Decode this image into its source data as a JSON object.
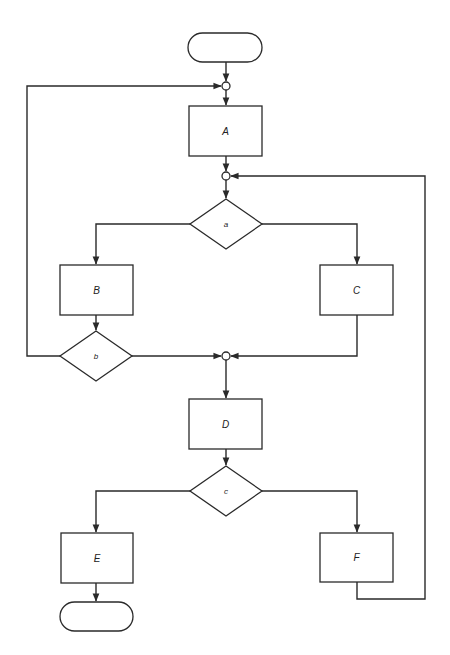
{
  "diagram": {
    "type": "flowchart",
    "colors": {
      "line": "#2a2a2a",
      "fill": "#ffffff",
      "text": "#222222"
    },
    "terminals": [
      {
        "id": "start",
        "label": "",
        "x": 188,
        "y": 33,
        "w": 74,
        "h": 29
      },
      {
        "id": "end",
        "label": "",
        "x": 60,
        "y": 602,
        "w": 73,
        "h": 29
      }
    ],
    "processes": [
      {
        "id": "A",
        "label": "A",
        "x": 189,
        "y": 106,
        "w": 73,
        "h": 50
      },
      {
        "id": "B",
        "label": "B",
        "x": 60,
        "y": 265,
        "w": 73,
        "h": 50
      },
      {
        "id": "C",
        "label": "C",
        "x": 320,
        "y": 265,
        "w": 73,
        "h": 50
      },
      {
        "id": "D",
        "label": "D",
        "x": 189,
        "y": 399,
        "w": 73,
        "h": 50
      },
      {
        "id": "E",
        "label": "E",
        "x": 61,
        "y": 533,
        "w": 72,
        "h": 50
      },
      {
        "id": "F",
        "label": "F",
        "x": 320,
        "y": 533,
        "w": 73,
        "h": 49
      }
    ],
    "decisions": [
      {
        "id": "a",
        "label": "a",
        "cx": 226,
        "cy": 224,
        "hw": 36,
        "hh": 25
      },
      {
        "id": "b",
        "label": "b",
        "cx": 96,
        "cy": 356,
        "hw": 36,
        "hh": 25
      },
      {
        "id": "c",
        "label": "c",
        "cx": 226,
        "cy": 491,
        "hw": 36,
        "hh": 25
      }
    ],
    "connectors": [
      {
        "id": "m1",
        "cx": 226,
        "cy": 86,
        "r": 4
      },
      {
        "id": "m2",
        "cx": 226,
        "cy": 176,
        "r": 4
      },
      {
        "id": "m3",
        "cx": 226,
        "cy": 356,
        "r": 4
      }
    ]
  }
}
